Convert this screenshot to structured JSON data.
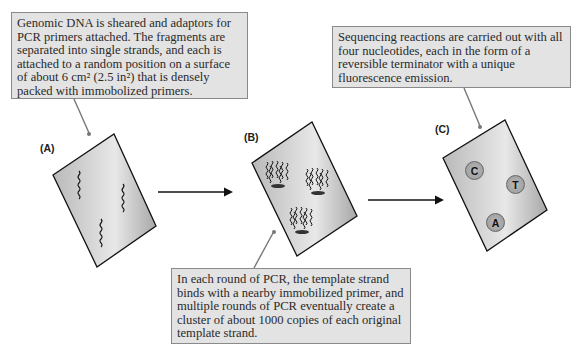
{
  "figure": {
    "panels": [
      {
        "id": "A",
        "label": "(A)",
        "description": "Flow cell with single-stranded DNA fragments attached",
        "callout": "Genomic DNA is sheared and adaptors for PCR primers attached. The fragments are separated into single strands, and each is attached to a random position on a surface of about 6 cm² (2.5 in²) that is densely packed with immobolized primers."
      },
      {
        "id": "B",
        "label": "(B)",
        "description": "Flow cell with amplified clusters",
        "callout": "In each round of PCR, the template strand binds with a nearby immobilized primer, and multiple rounds of PCR eventually create a cluster of about 1000 copies of each original template strand."
      },
      {
        "id": "C",
        "label": "(C)",
        "description": "Flow cell with fluorescent cluster reads",
        "callout": "Sequencing reactions are carried out with all four nucleotides, each in the form of a reversible terminator with a unique fluorescence emission.",
        "spots": [
          "C",
          "T",
          "A"
        ]
      }
    ],
    "arrows": [
      "A-to-B",
      "B-to-C"
    ],
    "colors": {
      "callout_fill": "#e3e3e3",
      "callout_border": "#8a8a8a",
      "slide_fill": "#c8c8c8",
      "spot_fill": "#a9a9a9"
    }
  }
}
